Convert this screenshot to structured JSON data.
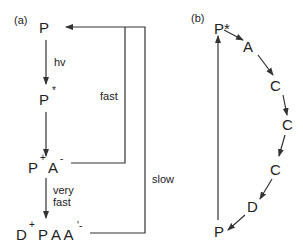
{
  "panel_a": {
    "label": "(a)",
    "states": {
      "ground": "P",
      "excited_base": "P",
      "excited_sup": "*",
      "cs1_p": "P",
      "cs1_p_sup": "+",
      "cs1_a": "A",
      "cs1_a_sup": "-",
      "cs2_d": "D",
      "cs2_d_sup": "+",
      "cs2_rest": "P A A",
      "cs2_sup": "'-"
    },
    "arrows": {
      "excitation": "hv",
      "charge_sep": "very fast",
      "charge_sep_line1": "very",
      "charge_sep_line2": "fast",
      "recomb_fast": "fast",
      "recomb_slow": "slow"
    }
  },
  "panel_b": {
    "label": "(b)",
    "nodes": [
      "P*",
      "A",
      "C",
      "C",
      "C",
      "D",
      "P"
    ]
  },
  "colors": {
    "line": "#333333",
    "text": "#222222",
    "background": "#ffffff"
  }
}
